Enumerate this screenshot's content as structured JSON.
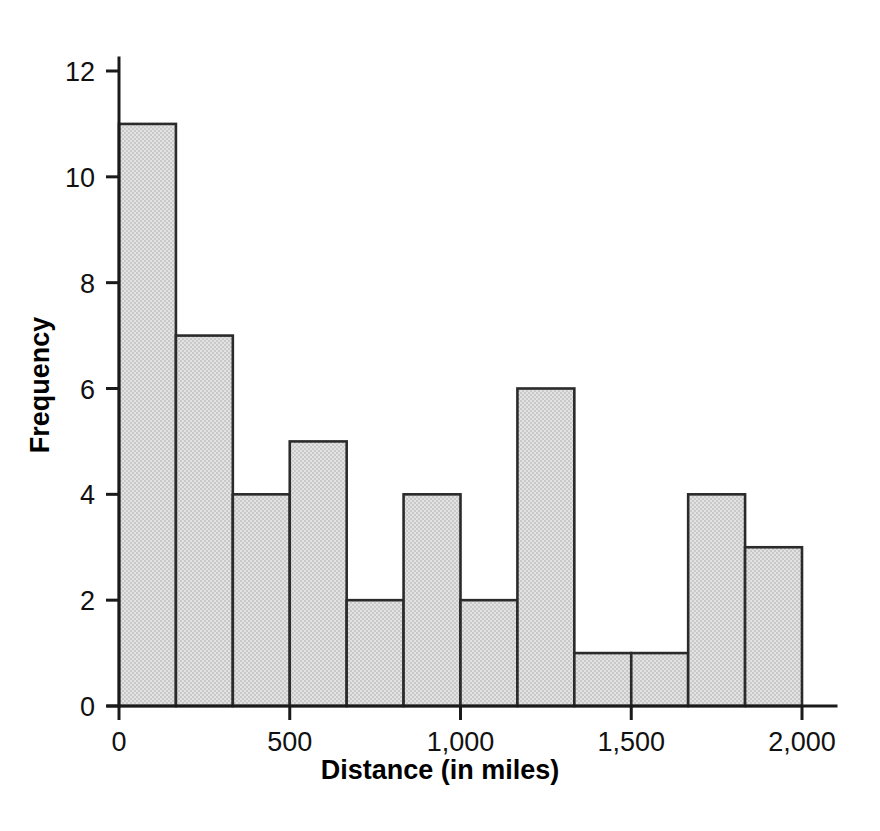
{
  "chart_data": {
    "type": "bar",
    "title": "",
    "subtitle": "",
    "xlabel": "Distance (in miles)",
    "ylabel": "Frequency",
    "xlim": [
      0,
      2000
    ],
    "ylim": [
      0,
      12.6
    ],
    "grid": false,
    "legend": "none",
    "bin_width": 166.67,
    "bin_count": 12,
    "bin_edges": [
      0,
      166.67,
      333.33,
      500,
      666.67,
      833.33,
      1000,
      1166.67,
      1333.33,
      1500,
      1666.67,
      1833.33,
      2000
    ],
    "categories": [
      "0-167",
      "167-333",
      "333-500",
      "500-667",
      "667-833",
      "833-1000",
      "1000-1167",
      "1167-1333",
      "1333-1500",
      "1500-1667",
      "1667-1833",
      "1833-2000"
    ],
    "values": [
      11,
      7,
      4,
      5,
      2,
      4,
      2,
      6,
      1,
      1,
      4,
      3
    ],
    "xticks": [
      0,
      500,
      1000,
      1500,
      2000
    ],
    "xtick_labels": [
      "0",
      "500",
      "1,000",
      "1,500",
      "2,000"
    ],
    "yticks": [
      0,
      2,
      4,
      6,
      8,
      10,
      12
    ],
    "ytick_labels": [
      "0",
      "2",
      "4",
      "6",
      "8",
      "10",
      "12"
    ],
    "bar_fill_color": "#d6d6d6",
    "bar_edge_color": "#2b2b2b",
    "axis_color": "#1a1a1a",
    "background_color": "#ffffff"
  }
}
